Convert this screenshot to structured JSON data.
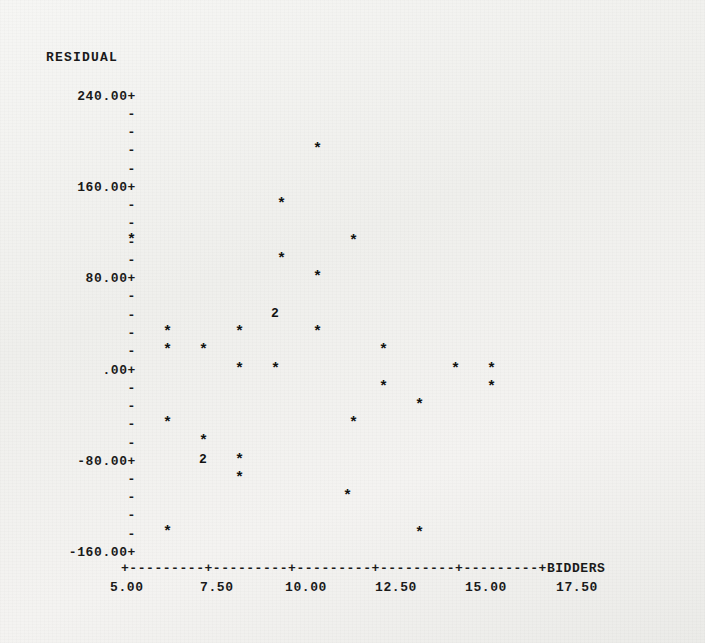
{
  "plot": {
    "title_y": "RESIDUAL",
    "title_x": "BIDDERS",
    "marker_glyph": "*",
    "axis_line": "+---------+---------+---------+---------+---------+",
    "tick_dash": "-",
    "tick_plus": "+",
    "ink_color": "#1a1a1a",
    "paper_color": "#f2f2f0"
  },
  "y_axis": {
    "label": "RESIDUAL",
    "labels": [
      "240.00+",
      "160.00+",
      "80.00+",
      ".00+",
      "-80.00+",
      "-160.00+"
    ],
    "values": [
      240,
      160,
      80,
      0,
      -80,
      -160
    ],
    "minor_per_major": 4,
    "range": [
      -160,
      240
    ]
  },
  "x_axis": {
    "label": "BIDDERS",
    "labels": [
      "5.00",
      "7.50",
      "10.00",
      "12.50",
      "15.00",
      "17.50"
    ],
    "values": [
      5.0,
      7.5,
      10.0,
      12.5,
      15.0,
      17.5
    ],
    "range": [
      5.0,
      17.5
    ]
  },
  "chart_data": {
    "type": "scatter",
    "title": "",
    "subtitle": "",
    "xlabel": "BIDDERS",
    "ylabel": "RESIDUAL",
    "xlim": [
      5.0,
      17.5
    ],
    "ylim": [
      -160,
      240
    ],
    "grid": false,
    "legend": "none",
    "marker": "*",
    "note": "Character-mode scatter plot; a digit glyph marks overplotted points (count of coincident observations).",
    "points": [
      {
        "x": 5.2,
        "y": 116,
        "marker": "*",
        "count": 1
      },
      {
        "x": 6.2,
        "y": 34,
        "marker": "*",
        "count": 1
      },
      {
        "x": 6.2,
        "y": 16,
        "marker": "*",
        "count": 1
      },
      {
        "x": 6.2,
        "y": -42,
        "marker": "*",
        "count": 1
      },
      {
        "x": 6.2,
        "y": -148,
        "marker": "*",
        "count": 1
      },
      {
        "x": 7.2,
        "y": 16,
        "marker": "*",
        "count": 1
      },
      {
        "x": 7.2,
        "y": -62,
        "marker": "*",
        "count": 1
      },
      {
        "x": 7.5,
        "y": -80,
        "marker": "2",
        "count": 2
      },
      {
        "x": 8.2,
        "y": 34,
        "marker": "*",
        "count": 1
      },
      {
        "x": 8.2,
        "y": 0,
        "marker": "*",
        "count": 1
      },
      {
        "x": 8.2,
        "y": -80,
        "marker": "*",
        "count": 1
      },
      {
        "x": 8.2,
        "y": -96,
        "marker": "*",
        "count": 1
      },
      {
        "x": 9.2,
        "y": 0,
        "marker": "*",
        "count": 1
      },
      {
        "x": 9.4,
        "y": 144,
        "marker": "*",
        "count": 1
      },
      {
        "x": 9.4,
        "y": 96,
        "marker": "*",
        "count": 1
      },
      {
        "x": 10.0,
        "y": 48,
        "marker": "2",
        "count": 2
      },
      {
        "x": 10.2,
        "y": 200,
        "marker": "*",
        "count": 1
      },
      {
        "x": 10.2,
        "y": 82,
        "marker": "*",
        "count": 1
      },
      {
        "x": 10.2,
        "y": 34,
        "marker": "*",
        "count": 1
      },
      {
        "x": 11.3,
        "y": -34,
        "marker": "*",
        "count": 1
      },
      {
        "x": 11.3,
        "y": -112,
        "marker": "*",
        "count": 1
      },
      {
        "x": 11.6,
        "y": 122,
        "marker": "*",
        "count": 1
      },
      {
        "x": 12.3,
        "y": 18,
        "marker": "*",
        "count": 1
      },
      {
        "x": 12.3,
        "y": -18,
        "marker": "*",
        "count": 1
      },
      {
        "x": 13.1,
        "y": -148,
        "marker": "*",
        "count": 1
      },
      {
        "x": 13.3,
        "y": -34,
        "marker": "*",
        "count": 1
      },
      {
        "x": 14.4,
        "y": 0,
        "marker": "*",
        "count": 1
      },
      {
        "x": 15.4,
        "y": 0,
        "marker": "*",
        "count": 1
      },
      {
        "x": 15.4,
        "y": -16,
        "marker": "*",
        "count": 1
      }
    ]
  },
  "markers": [
    {
      "name": "pt-1",
      "glyph": "*",
      "left": 127,
      "top": 233
    },
    {
      "name": "pt-2",
      "glyph": "*",
      "left": 163,
      "top": 325
    },
    {
      "name": "pt-3",
      "glyph": "*",
      "left": 163,
      "top": 343
    },
    {
      "name": "pt-4",
      "glyph": "*",
      "left": 163,
      "top": 416
    },
    {
      "name": "pt-5",
      "glyph": "*",
      "left": 163,
      "top": 525
    },
    {
      "name": "pt-6",
      "glyph": "*",
      "left": 199,
      "top": 343
    },
    {
      "name": "pt-7",
      "glyph": "*",
      "left": 199,
      "top": 434
    },
    {
      "name": "pt-8",
      "glyph": "2",
      "left": 199,
      "top": 453
    },
    {
      "name": "pt-9",
      "glyph": "*",
      "left": 235,
      "top": 325
    },
    {
      "name": "pt-10",
      "glyph": "*",
      "left": 235,
      "top": 362
    },
    {
      "name": "pt-11",
      "glyph": "*",
      "left": 235,
      "top": 453
    },
    {
      "name": "pt-12",
      "glyph": "*",
      "left": 235,
      "top": 471
    },
    {
      "name": "pt-13",
      "glyph": "*",
      "left": 271,
      "top": 362
    },
    {
      "name": "pt-14",
      "glyph": "*",
      "left": 277,
      "top": 197
    },
    {
      "name": "pt-15",
      "glyph": "*",
      "left": 277,
      "top": 252
    },
    {
      "name": "pt-16",
      "glyph": "2",
      "left": 271,
      "top": 307
    },
    {
      "name": "pt-17",
      "glyph": "*",
      "left": 313,
      "top": 142
    },
    {
      "name": "pt-18",
      "glyph": "*",
      "left": 313,
      "top": 270
    },
    {
      "name": "pt-19",
      "glyph": "*",
      "left": 313,
      "top": 325
    },
    {
      "name": "pt-20",
      "glyph": "*",
      "left": 349,
      "top": 416
    },
    {
      "name": "pt-21",
      "glyph": "*",
      "left": 343,
      "top": 489
    },
    {
      "name": "pt-22",
      "glyph": "*",
      "left": 349,
      "top": 234
    },
    {
      "name": "pt-23",
      "glyph": "*",
      "left": 379,
      "top": 343
    },
    {
      "name": "pt-24",
      "glyph": "*",
      "left": 379,
      "top": 380
    },
    {
      "name": "pt-25",
      "glyph": "*",
      "left": 415,
      "top": 526
    },
    {
      "name": "pt-26",
      "glyph": "*",
      "left": 415,
      "top": 398
    },
    {
      "name": "pt-27",
      "glyph": "*",
      "left": 451,
      "top": 362
    },
    {
      "name": "pt-28",
      "glyph": "*",
      "left": 487,
      "top": 362
    },
    {
      "name": "pt-29",
      "glyph": "*",
      "left": 487,
      "top": 380
    }
  ],
  "y_rows": [
    {
      "text": "240.00+",
      "top": 89,
      "major": true
    },
    {
      "text": "-",
      "top": 107,
      "major": false
    },
    {
      "text": "-",
      "top": 125,
      "major": false
    },
    {
      "text": "-",
      "top": 143,
      "major": false
    },
    {
      "text": "-",
      "top": 162,
      "major": false
    },
    {
      "text": "160.00+",
      "top": 180,
      "major": true
    },
    {
      "text": "-",
      "top": 198,
      "major": false
    },
    {
      "text": "-",
      "top": 216,
      "major": false
    },
    {
      "text": "-",
      "top": 235,
      "major": false
    },
    {
      "text": "-",
      "top": 253,
      "major": false
    },
    {
      "text": "80.00+",
      "top": 271,
      "major": true
    },
    {
      "text": "-",
      "top": 289,
      "major": false
    },
    {
      "text": "-",
      "top": 308,
      "major": false
    },
    {
      "text": "-",
      "top": 326,
      "major": false
    },
    {
      "text": "-",
      "top": 344,
      "major": false
    },
    {
      "text": ".00+",
      "top": 363,
      "major": true
    },
    {
      "text": "-",
      "top": 381,
      "major": false
    },
    {
      "text": "-",
      "top": 399,
      "major": false
    },
    {
      "text": "-",
      "top": 417,
      "major": false
    },
    {
      "text": "-",
      "top": 436,
      "major": false
    },
    {
      "text": "-80.00+",
      "top": 454,
      "major": true
    },
    {
      "text": "-",
      "top": 472,
      "major": false
    },
    {
      "text": "-",
      "top": 490,
      "major": false
    },
    {
      "text": "-",
      "top": 508,
      "major": false
    },
    {
      "text": "-",
      "top": 527,
      "major": false
    },
    {
      "text": "-160.00+",
      "top": 545,
      "major": true
    }
  ],
  "x_ticks": [
    {
      "text": "5.00",
      "left": 110
    },
    {
      "text": "7.50",
      "left": 200
    },
    {
      "text": "10.00",
      "left": 285
    },
    {
      "text": "12.50",
      "left": 375
    },
    {
      "text": "15.00",
      "left": 465
    },
    {
      "text": "17.50",
      "left": 556
    }
  ]
}
